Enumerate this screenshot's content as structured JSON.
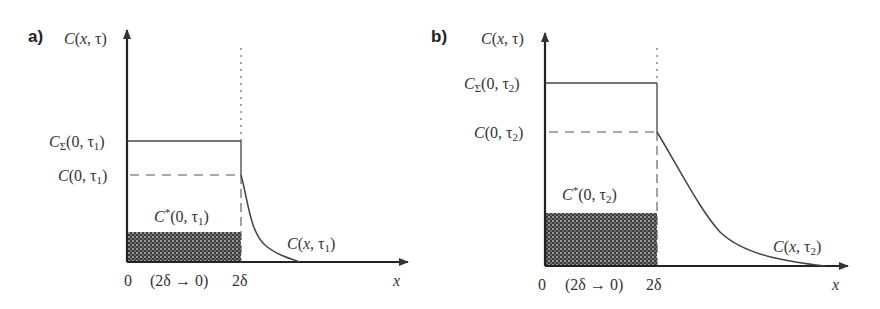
{
  "panels": [
    {
      "id": "a",
      "label": "a)",
      "y_axis_label": "C(x, τ)",
      "x_axis_label": "x",
      "x_ticks": [
        "0",
        "(2δ → 0)",
        "2δ"
      ],
      "level_total_label": "CΣ(0, τ1)",
      "level_surface_label": "C(0, τ1)",
      "shaded_label": "C*(0, τ1)",
      "curve_label": "C(x, τ1)",
      "levels": {
        "total": 0.52,
        "surface": 0.38,
        "shaded": 0.13
      },
      "curve_decay": "steep"
    },
    {
      "id": "b",
      "label": "b)",
      "y_axis_label": "C(x, τ)",
      "x_axis_label": "x",
      "x_ticks": [
        "0",
        "(2δ → 0)",
        "2δ"
      ],
      "level_total_label": "CΣ(0, τ2)",
      "level_surface_label": "C(0, τ2)",
      "shaded_label": "C*(0, τ2)",
      "curve_label": "C(x, τ2)",
      "levels": {
        "total": 0.8,
        "surface": 0.6,
        "shaded": 0.23
      },
      "curve_decay": "gradual"
    }
  ],
  "text": {
    "a_label": "a)",
    "b_label": "b)",
    "C": "C",
    "x_tau": "(x, τ)",
    "x": "x",
    "zero": "0",
    "range": "(2δ",
    "range_end": "0)",
    "two_delta": "2δ",
    "a_sigma": "Σ",
    "a_args_total": "(0, τ",
    "a_args_surface": "(0, τ",
    "a_curve_args": "(x, τ",
    "sub1": "1",
    "sub2": "2",
    "close": ")",
    "star": "*"
  }
}
